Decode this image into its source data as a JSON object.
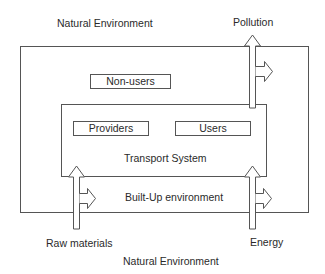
{
  "diagram": {
    "labels": {
      "natural_env_top": "Natural Environment",
      "pollution": "Pollution",
      "non_users": "Non-users",
      "providers": "Providers",
      "users": "Users",
      "transport_system": "Transport System",
      "built_up": "Built-Up environment",
      "raw_materials": "Raw materials",
      "energy": "Energy",
      "natural_env_bottom": "Natural Environment"
    },
    "nodes": [
      {
        "id": "natural-environment",
        "label": "Natural Environment",
        "type": "outside-region"
      },
      {
        "id": "built-up-environment",
        "label": "Built-Up environment",
        "type": "outer-box"
      },
      {
        "id": "transport-system",
        "label": "Transport System",
        "type": "inner-box"
      },
      {
        "id": "non-users",
        "label": "Non-users",
        "type": "box"
      },
      {
        "id": "providers",
        "label": "Providers",
        "type": "box"
      },
      {
        "id": "users",
        "label": "Users",
        "type": "box"
      }
    ],
    "flows": [
      {
        "label": "Raw materials",
        "direction": "into transport system from below",
        "branch": "into built-up environment"
      },
      {
        "label": "Energy",
        "direction": "into transport system from below",
        "branch": "into built-up environment"
      },
      {
        "label": "Pollution",
        "direction": "out of transport system to natural environment above",
        "branch": "into built-up environment"
      }
    ],
    "colors": {
      "line": "#555555",
      "text": "#2a2a2a",
      "background": "#ffffff"
    }
  }
}
